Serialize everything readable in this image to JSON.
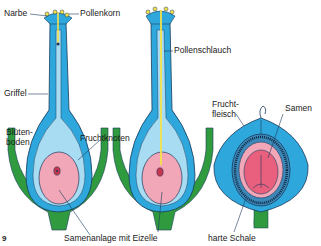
{
  "figure_number": "9",
  "colors": {
    "pistil_outer": "#2ea8dc",
    "pistil_inner": "#a8dcf2",
    "outline": "#1b3a5c",
    "ovule": "#f2a7b8",
    "seed_core": "#e8607e",
    "receptacle": "#2f9a3e",
    "pollen": "#f4e24a",
    "pollen_tube": "#f4e24a"
  },
  "labels": {
    "narbe": "Narbe",
    "pollenkorn": "Pollenkorn",
    "griffel": "Griffel",
    "bluetenboden_1": "Blüten-",
    "bluetenboden_2": "boden",
    "fruchtknoten": "Fruchtknoten",
    "samenanlage": "Samenanlage mit Eizelle",
    "pollenschlauch": "Pollenschlauch",
    "fruchtfleisch_1": "Frucht-",
    "fruchtfleisch_2": "fleisch",
    "samen": "Samen",
    "harte_schale": "harte Schale"
  },
  "stages": [
    {
      "name": "pistil-with-pollen"
    },
    {
      "name": "pistil-with-pollen-tube"
    },
    {
      "name": "fruit-with-seed"
    }
  ]
}
